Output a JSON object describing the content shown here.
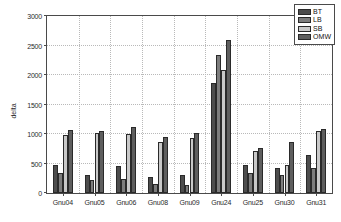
{
  "chart_data": {
    "type": "bar",
    "title": "",
    "xlabel": "",
    "ylabel": "delta",
    "ylim": [
      0,
      3000
    ],
    "yticks": [
      0,
      500,
      1000,
      1500,
      2000,
      2500,
      3000
    ],
    "ytick_labels": [
      "0",
      "500",
      "1000",
      "1500",
      "2000",
      "2500",
      "3000"
    ],
    "grid": true,
    "legend_position": "top-right",
    "categories": [
      "Gnu04",
      "Gnu05",
      "Gnu06",
      "Gnu08",
      "Gnu09",
      "Gnu24",
      "Gnu25",
      "Gnu30",
      "Gnu31"
    ],
    "series": [
      {
        "name": "BT",
        "color": "#4d4d4d",
        "values": [
          470,
          310,
          450,
          270,
          300,
          1860,
          470,
          430,
          640
        ]
      },
      {
        "name": "LB",
        "color": "#7d7d7d",
        "values": [
          340,
          215,
          235,
          155,
          140,
          2335,
          335,
          300,
          425
        ]
      },
      {
        "name": "SB",
        "color": "#c9c9c9",
        "values": [
          985,
          1020,
          1005,
          870,
          925,
          2080,
          705,
          475,
          1045
        ]
      },
      {
        "name": "OMW",
        "color": "#5e5e5e",
        "values": [
          1060,
          1050,
          1115,
          950,
          1010,
          2595,
          770,
          870,
          1090
        ]
      }
    ]
  }
}
